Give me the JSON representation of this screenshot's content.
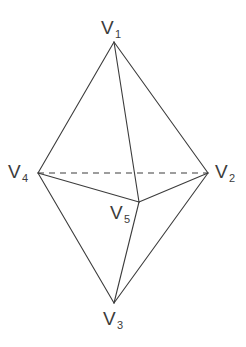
{
  "figure": {
    "kind": "geometry-diagram",
    "shape_name": "triangular bipyramid",
    "background_color": "#ffffff",
    "stroke_color": "#3c3c3c",
    "label_color": "#3c3c3c",
    "stroke_width": 1.1,
    "dash_pattern": "6 5",
    "width": 246,
    "height": 347
  },
  "labels": {
    "v1": {
      "base": "V",
      "sub": "1"
    },
    "v2": {
      "base": "V",
      "sub": "2"
    },
    "v3": {
      "base": "V",
      "sub": "3"
    },
    "v4": {
      "base": "V",
      "sub": "4"
    },
    "v5": {
      "base": "V",
      "sub": "5"
    }
  },
  "chart_data": {
    "type": "diagram",
    "title": "",
    "vertices": [
      {
        "id": "V1",
        "label": "V1",
        "x": 114,
        "y": 42,
        "role": "top-apex"
      },
      {
        "id": "V2",
        "label": "V2",
        "x": 208,
        "y": 173,
        "role": "right"
      },
      {
        "id": "V3",
        "label": "V3",
        "x": 114,
        "y": 303,
        "role": "bottom-apex"
      },
      {
        "id": "V4",
        "label": "V4",
        "x": 38,
        "y": 173,
        "role": "left"
      },
      {
        "id": "V5",
        "label": "V5",
        "x": 139,
        "y": 202,
        "role": "front-center"
      }
    ],
    "edges": [
      {
        "from": "V1",
        "to": "V4",
        "style": "solid"
      },
      {
        "from": "V1",
        "to": "V2",
        "style": "solid"
      },
      {
        "from": "V1",
        "to": "V5",
        "style": "solid"
      },
      {
        "from": "V4",
        "to": "V5",
        "style": "solid"
      },
      {
        "from": "V5",
        "to": "V2",
        "style": "solid"
      },
      {
        "from": "V4",
        "to": "V3",
        "style": "solid"
      },
      {
        "from": "V5",
        "to": "V3",
        "style": "solid"
      },
      {
        "from": "V2",
        "to": "V3",
        "style": "solid"
      },
      {
        "from": "V4",
        "to": "V2",
        "style": "dashed",
        "note": "hidden back edge"
      }
    ]
  }
}
